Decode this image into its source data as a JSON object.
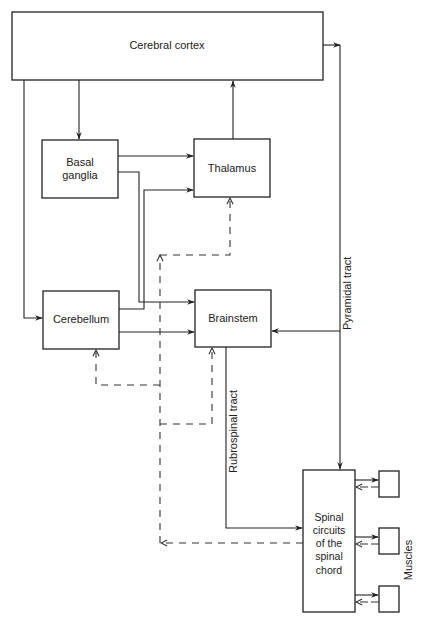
{
  "diagram": {
    "nodes": {
      "cerebral_cortex": "Cerebral cortex",
      "basal_ganglia_line1": "Basal",
      "basal_ganglia_line2": "ganglia",
      "thalamus": "Thalamus",
      "cerebellum": "Cerebellum",
      "brainstem": "Brainstem",
      "spinal_line1": "Spinal",
      "spinal_line2": "circuits",
      "spinal_line3": "of the",
      "spinal_line4": "spinal",
      "spinal_line5": "chord"
    },
    "labels": {
      "pyramidal_tract": "Pyramidal tract",
      "rubrospinal_tract": "Rubrospinal tract",
      "muscles": "Muscles"
    },
    "colors": {
      "stroke": "#222222",
      "background": "#ffffff"
    },
    "edges": [
      {
        "from": "Cerebral cortex",
        "to": "Basal ganglia",
        "style": "solid"
      },
      {
        "from": "Cerebral cortex",
        "to": "Cerebellum",
        "style": "solid"
      },
      {
        "from": "Thalamus",
        "to": "Cerebral cortex",
        "style": "solid"
      },
      {
        "from": "Basal ganglia",
        "to": "Thalamus",
        "style": "solid"
      },
      {
        "from": "Basal ganglia",
        "to": "Brainstem",
        "style": "solid"
      },
      {
        "from": "Cerebellum",
        "to": "Thalamus",
        "style": "solid"
      },
      {
        "from": "Cerebellum",
        "to": "Brainstem",
        "style": "solid"
      },
      {
        "from": "Cerebral cortex",
        "to": "Spinal circuits of the spinal chord",
        "style": "solid",
        "label": "Pyramidal tract"
      },
      {
        "from": "Cerebral cortex",
        "to": "Brainstem",
        "style": "solid",
        "via": "Pyramidal tract"
      },
      {
        "from": "Brainstem",
        "to": "Spinal circuits of the spinal chord",
        "style": "solid",
        "label": "Rubrospinal tract"
      },
      {
        "from": "Spinal circuits of the spinal chord",
        "to": "Muscles",
        "style": "solid"
      },
      {
        "from": "Muscles",
        "to": "Spinal circuits of the spinal chord",
        "style": "dashed"
      },
      {
        "from": "Spinal circuits of the spinal chord",
        "to": "Cerebellum",
        "style": "dashed"
      },
      {
        "from": "Spinal circuits of the spinal chord",
        "to": "Thalamus",
        "style": "dashed"
      },
      {
        "from": "Spinal circuits of the spinal chord",
        "to": "Brainstem",
        "style": "dashed"
      }
    ]
  }
}
